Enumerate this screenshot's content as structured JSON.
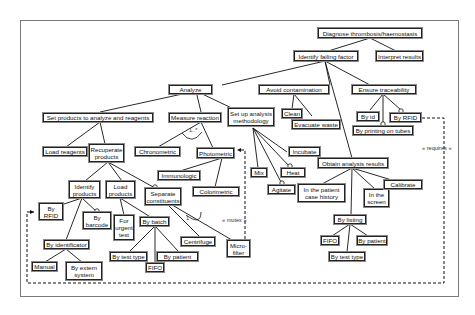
{
  "diagram": {
    "title": "Diagnose thrombosis/haemostasis",
    "nodes": {
      "root": "Diagnose thrombosis/haemostasis",
      "identify_failing_factor": "Identify failing factor",
      "interpret_results": "Interpret results",
      "analyze": "Analyze",
      "avoid_contamination": "Avoid contamination",
      "ensure_traceability": "Ensure traceability",
      "clean": "Clean",
      "evacuate_waste": "Evacuate waste",
      "by_id": "By id",
      "by_rfid_top": "By RFID",
      "by_printing_on_tubes": "By printing on tubes",
      "set_products": "Set products to analyze and reagents",
      "measure_reaction": "Measure reaction",
      "set_up_methodology": "Set up analysis methodology",
      "load_reagents": "Load reagents",
      "recuperate_products": "Recuperate products",
      "chronometric": "Chronometric",
      "photometric": "Photometric",
      "immunologic": "Immunologic",
      "colorimetric": "Colorimetric",
      "mix": "Mix",
      "agitate": "Agitate",
      "incubate": "Incubate",
      "heat": "Heat",
      "obtain_results": "Obtain analysis results",
      "patient_case_history": "In the patient case history",
      "in_the_screen": "In the screen",
      "calibrate": "Calibrate",
      "by_listing": "By listing",
      "fifo_listing": "FIFO",
      "by_patient_listing": "By patient",
      "by_test_type_listing": "By test type",
      "identify_products": "Identify products",
      "load_products": "Load products",
      "separate_constituents": "Separate constituents",
      "by_rfid_left": "By RFID",
      "by_barcode": "By barcode",
      "for_urgent_test": "For urgent test",
      "by_batch": "By batch",
      "by_identificator": "By identificator",
      "manual": "Manual",
      "by_extern_system": "By extern system",
      "by_test_type_batch": "By test type",
      "fifo_batch": "FIFO",
      "by_patient_batch": "By patient",
      "centrifuge": "Centrifuge",
      "micro_filter": "Micro-filter"
    },
    "annotations": {
      "cardinality": "1..*",
      "cardinality_one": "1",
      "mutex": "« mutex »",
      "requires": "« requires »"
    }
  }
}
